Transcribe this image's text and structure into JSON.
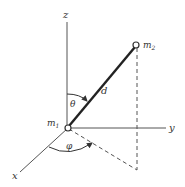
{
  "diagram": {
    "axes": {
      "z": {
        "label": "z"
      },
      "y": {
        "label": "y"
      },
      "x": {
        "label": "x"
      }
    },
    "masses": {
      "m1": {
        "label": "m",
        "subscript": "1"
      },
      "m2": {
        "label": "m",
        "subscript": "2"
      }
    },
    "distance": {
      "label": "d"
    },
    "angles": {
      "polar": {
        "label": "θ"
      },
      "azimuthal": {
        "label": "φ"
      }
    },
    "colors": {
      "line": "#333333",
      "background": "#ffffff"
    }
  }
}
